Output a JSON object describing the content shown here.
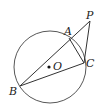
{
  "diagram": {
    "type": "geometry",
    "circle": {
      "center_label": "O",
      "cx": 50,
      "cy": 67,
      "r": 36
    },
    "points": {
      "P": {
        "label": "P",
        "x": 90,
        "y": 21
      },
      "A": {
        "label": "A",
        "x": 69,
        "y": 38
      },
      "B": {
        "label": "B",
        "x": 20,
        "y": 86
      },
      "C": {
        "label": "C",
        "x": 84,
        "y": 63
      },
      "O": {
        "label": "O",
        "x": 49,
        "y": 67
      }
    },
    "segments": [
      "PB",
      "PC",
      "AC",
      "BC"
    ],
    "stroke_color": "#333333"
  }
}
